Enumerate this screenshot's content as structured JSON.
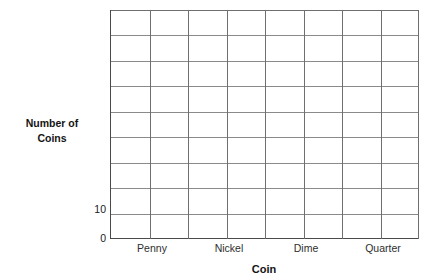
{
  "chart_data": {
    "type": "bar",
    "title": "Coins",
    "subtitle_visible": "partially cut off at top edge",
    "categories": [
      "Penny",
      "Nickel",
      "Dime",
      "Quarter"
    ],
    "values": [
      null,
      null,
      null,
      null
    ],
    "series": [
      {
        "name": "Number of Coins",
        "values": [
          null,
          null,
          null,
          null
        ]
      }
    ],
    "xlabel": "Coin",
    "ylabel": "Number of Coins",
    "ylim": [
      0,
      90
    ],
    "y_tick_labels": [
      "0",
      "10"
    ],
    "y_tick_values": [
      0,
      10
    ],
    "y_gridline_count": 9,
    "y_gridline_interval": 10,
    "x_column_count": 8,
    "x_columns_per_category": 2,
    "grid": true,
    "legend": "none",
    "note": "Blank bar-graph template; no bars are plotted"
  },
  "axes": {
    "y_title_line1": "Number of",
    "y_title_line2": "Coins",
    "y_ticks": [
      {
        "label": "10"
      },
      {
        "label": "0"
      }
    ],
    "x_title": "Coin",
    "x_ticks": [
      {
        "label": "Penny"
      },
      {
        "label": "Nickel"
      },
      {
        "label": "Dime"
      },
      {
        "label": "Quarter"
      }
    ]
  },
  "style": {
    "grid_color": "#8a8a8a",
    "grid_minor_color": "#9b9b9b",
    "axis_color": "#4a4a4a",
    "background": "#ffffff",
    "text_color": "#1a1a1a"
  }
}
